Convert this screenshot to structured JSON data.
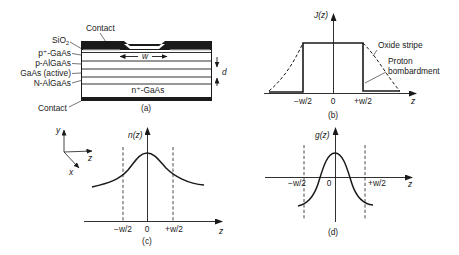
{
  "figure": {
    "panels": {
      "a": {
        "caption": "(a)",
        "layer_labels": {
          "contact_top": "Contact",
          "sio2": "SiO",
          "sio2_sub": "2",
          "p_plus_gaas": "p⁺-GaAs",
          "p_algaas": "p-AlGaAs",
          "gaas_active": "GaAs (active)",
          "n_algaas": "N-AlGaAs",
          "contact_bottom": "Contact",
          "substrate": "n⁺-GaAs"
        },
        "stripe_width_label": "w",
        "thickness_label": "d"
      },
      "b": {
        "caption": "(b)",
        "y_axis_label": "J(z)",
        "x_axis_label": "z",
        "ticks": [
          "−w/2",
          "0",
          "+w/2"
        ],
        "legend": {
          "oxide_stripe": "Oxide stripe",
          "proton_line1": "Proton",
          "proton_line2": "bombardment"
        }
      },
      "c": {
        "caption": "(c)",
        "y_axis_label": "n(z)",
        "x_axis_label": "z",
        "ticks": [
          "−w/2",
          "0",
          "+w/2"
        ],
        "coord_axes": {
          "y": "y",
          "z": "z",
          "x": "x"
        }
      },
      "d": {
        "caption": "(d)",
        "y_axis_label": "g(z)",
        "x_axis_label": "z",
        "ticks": [
          "−w/2",
          "0",
          "+w/2"
        ]
      }
    }
  }
}
